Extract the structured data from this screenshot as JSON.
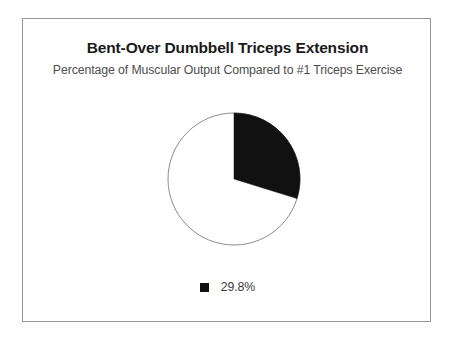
{
  "figure": {
    "title": "Bent-Over Dumbbell Triceps Extension",
    "subtitle": "Percentage of Muscular Output Compared to #1 Triceps Exercise",
    "frame_color": "#949494",
    "background": "#ffffff"
  },
  "legend": {
    "items": [
      {
        "label": "29.8%",
        "color": "#111111",
        "marker": "square-marker-icon"
      }
    ]
  },
  "chart_data": {
    "type": "pie",
    "title": "Bent-Over Dumbbell Triceps Extension",
    "subtitle": "Percentage of Muscular Output Compared to #1 Triceps Exercise",
    "xlabel": "",
    "ylabel": "",
    "categories": [
      "29.8%",
      ""
    ],
    "values": [
      29.8,
      70.2
    ],
    "colors": [
      "#111111",
      "#ffffff"
    ],
    "slice_outline_color": "#8c8c8c",
    "start_angle_deg": 0,
    "direction": "clockwise",
    "legend_position": "bottom",
    "grid": false,
    "labels": [
      "29.8%"
    ],
    "series": [
      {
        "name": "Percentage of Muscular Output",
        "values": [
          29.8,
          70.2
        ]
      }
    ]
  }
}
